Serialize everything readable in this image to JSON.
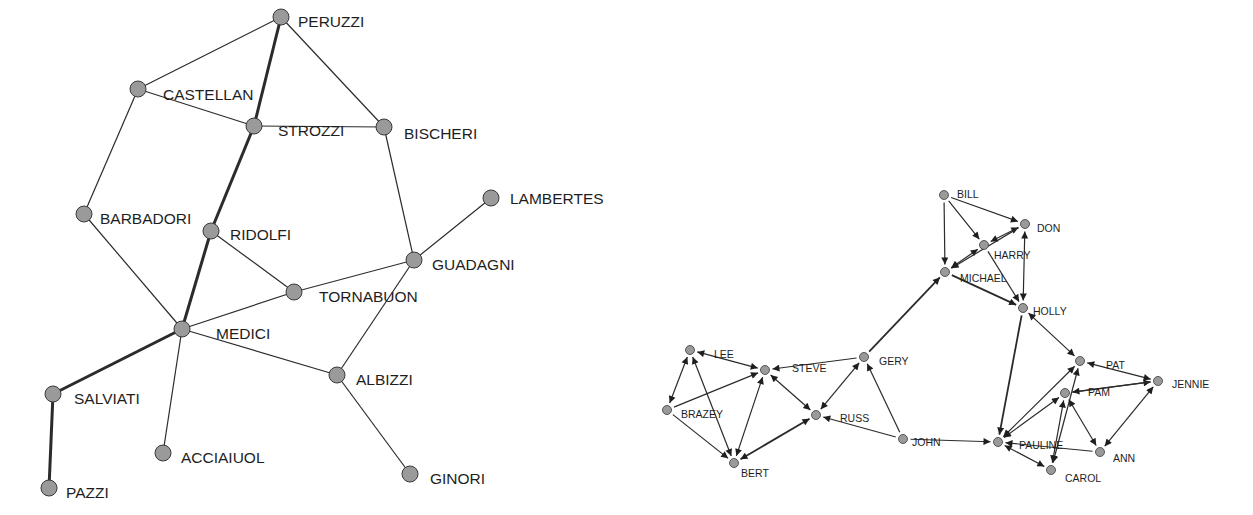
{
  "colors": {
    "background": "#ffffff",
    "node_fill": "#9a9a9a",
    "node_stroke": "#3a3a3a",
    "edge": "#2b2b2b",
    "label": "#1e1e1e"
  },
  "left_network": {
    "title": "",
    "directed": false,
    "node_radius": 8,
    "nodes": [
      {
        "id": "PERUZZI",
        "label": "PERUZZI",
        "x": 281,
        "y": 17,
        "lx": 298,
        "ly": 23
      },
      {
        "id": "CASTELLAN",
        "label": "CASTELLAN",
        "x": 138,
        "y": 89,
        "lx": 163,
        "ly": 96
      },
      {
        "id": "STROZZI",
        "label": "STROZZI",
        "x": 254,
        "y": 126,
        "lx": 278,
        "ly": 132
      },
      {
        "id": "BISCHERI",
        "label": "BISCHERI",
        "x": 384,
        "y": 127,
        "lx": 404,
        "ly": 135
      },
      {
        "id": "LAMBERTES",
        "label": "LAMBERTES",
        "x": 491,
        "y": 198,
        "lx": 510,
        "ly": 200
      },
      {
        "id": "BARBADORI",
        "label": "BARBADORI",
        "x": 84,
        "y": 214,
        "lx": 100,
        "ly": 220
      },
      {
        "id": "RIDOLFI",
        "label": "RIDOLFI",
        "x": 211,
        "y": 231,
        "lx": 230,
        "ly": 236
      },
      {
        "id": "GUADAGNI",
        "label": "GUADAGNI",
        "x": 414,
        "y": 260,
        "lx": 432,
        "ly": 266
      },
      {
        "id": "TORNABUON",
        "label": "TORNABUON",
        "x": 294,
        "y": 292,
        "lx": 319,
        "ly": 298
      },
      {
        "id": "MEDICI",
        "label": "MEDICI",
        "x": 182,
        "y": 329,
        "lx": 216,
        "ly": 335
      },
      {
        "id": "ALBIZZI",
        "label": "ALBIZZI",
        "x": 337,
        "y": 375,
        "lx": 356,
        "ly": 381
      },
      {
        "id": "SALVIATI",
        "label": "SALVIATI",
        "x": 53,
        "y": 394,
        "lx": 74,
        "ly": 400
      },
      {
        "id": "ACCIAIUOL",
        "label": "ACCIAIUOL",
        "x": 163,
        "y": 453,
        "lx": 181,
        "ly": 459
      },
      {
        "id": "GINORI",
        "label": "GINORI",
        "x": 410,
        "y": 474,
        "lx": 430,
        "ly": 480
      },
      {
        "id": "PAZZI",
        "label": "PAZZI",
        "x": 49,
        "y": 488,
        "lx": 66,
        "ly": 494
      }
    ],
    "edges": [
      {
        "from": "PERUZZI",
        "to": "CASTELLAN",
        "width": 1.2
      },
      {
        "from": "PERUZZI",
        "to": "STROZZI",
        "width": 3
      },
      {
        "from": "PERUZZI",
        "to": "BISCHERI",
        "width": 1.2
      },
      {
        "from": "CASTELLAN",
        "to": "STROZZI",
        "width": 1.2
      },
      {
        "from": "CASTELLAN",
        "to": "BARBADORI",
        "width": 1.2
      },
      {
        "from": "STROZZI",
        "to": "BISCHERI",
        "width": 1.2
      },
      {
        "from": "STROZZI",
        "to": "RIDOLFI",
        "width": 3
      },
      {
        "from": "BISCHERI",
        "to": "GUADAGNI",
        "width": 1.2
      },
      {
        "from": "LAMBERTES",
        "to": "GUADAGNI",
        "width": 1.2
      },
      {
        "from": "BARBADORI",
        "to": "MEDICI",
        "width": 1.2
      },
      {
        "from": "RIDOLFI",
        "to": "TORNABUON",
        "width": 1.2
      },
      {
        "from": "RIDOLFI",
        "to": "MEDICI",
        "width": 3
      },
      {
        "from": "GUADAGNI",
        "to": "TORNABUON",
        "width": 1.2
      },
      {
        "from": "GUADAGNI",
        "to": "ALBIZZI",
        "width": 1.2
      },
      {
        "from": "TORNABUON",
        "to": "MEDICI",
        "width": 1.2
      },
      {
        "from": "MEDICI",
        "to": "ALBIZZI",
        "width": 1.2
      },
      {
        "from": "MEDICI",
        "to": "SALVIATI",
        "width": 3
      },
      {
        "from": "MEDICI",
        "to": "ACCIAIUOL",
        "width": 1.2
      },
      {
        "from": "ALBIZZI",
        "to": "GINORI",
        "width": 1.2
      },
      {
        "from": "SALVIATI",
        "to": "PAZZI",
        "width": 3
      }
    ]
  },
  "right_network": {
    "title": "",
    "directed": true,
    "node_radius": 4.5,
    "nodes": [
      {
        "id": "BILL",
        "label": "BILL",
        "x": 944,
        "y": 195,
        "lx": 957,
        "ly": 195
      },
      {
        "id": "DON",
        "label": "DON",
        "x": 1025,
        "y": 224,
        "lx": 1037,
        "ly": 229
      },
      {
        "id": "HARRY",
        "label": "HARRY",
        "x": 984,
        "y": 245,
        "lx": 994,
        "ly": 256
      },
      {
        "id": "MICHAEL",
        "label": "MICHAEL",
        "x": 945,
        "y": 272,
        "lx": 960,
        "ly": 279
      },
      {
        "id": "HOLLY",
        "label": "HOLLY",
        "x": 1023,
        "y": 308,
        "lx": 1033,
        "ly": 312
      },
      {
        "id": "PAT",
        "label": "PAT",
        "x": 1080,
        "y": 361,
        "lx": 1106,
        "ly": 366
      },
      {
        "id": "JENNIE",
        "label": "JENNIE",
        "x": 1158,
        "y": 381,
        "lx": 1172,
        "ly": 385
      },
      {
        "id": "PAM",
        "label": "PAM",
        "x": 1065,
        "y": 393,
        "lx": 1088,
        "ly": 393
      },
      {
        "id": "PAULINE",
        "label": "PAULINE",
        "x": 998,
        "y": 442,
        "lx": 1019,
        "ly": 446
      },
      {
        "id": "ANN",
        "label": "ANN",
        "x": 1100,
        "y": 452,
        "lx": 1113,
        "ly": 459
      },
      {
        "id": "CAROL",
        "label": "CAROL",
        "x": 1051,
        "y": 470,
        "lx": 1065,
        "ly": 479
      },
      {
        "id": "LEE",
        "label": "LEE",
        "x": 690,
        "y": 350,
        "lx": 714,
        "ly": 355
      },
      {
        "id": "STEVE",
        "label": "STEVE",
        "x": 765,
        "y": 370,
        "lx": 792,
        "ly": 369
      },
      {
        "id": "GERY",
        "label": "GERY",
        "x": 864,
        "y": 357,
        "lx": 879,
        "ly": 362
      },
      {
        "id": "BRAZEY",
        "label": "BRAZEY",
        "x": 667,
        "y": 410,
        "lx": 681,
        "ly": 415
      },
      {
        "id": "RUSS",
        "label": "RUSS",
        "x": 816,
        "y": 415,
        "lx": 840,
        "ly": 419
      },
      {
        "id": "JOHN",
        "label": "JOHN",
        "x": 903,
        "y": 439,
        "lx": 912,
        "ly": 443
      },
      {
        "id": "BERT",
        "label": "BERT",
        "x": 734,
        "y": 463,
        "lx": 741,
        "ly": 474
      }
    ],
    "edges": [
      {
        "from": "BILL",
        "to": "DON",
        "both": false
      },
      {
        "from": "BILL",
        "to": "HARRY",
        "both": false
      },
      {
        "from": "BILL",
        "to": "MICHAEL",
        "both": false
      },
      {
        "from": "HARRY",
        "to": "DON",
        "both": true
      },
      {
        "from": "MICHAEL",
        "to": "HARRY",
        "both": true
      },
      {
        "from": "DON",
        "to": "MICHAEL",
        "both": false
      },
      {
        "from": "DON",
        "to": "HOLLY",
        "both": true
      },
      {
        "from": "MICHAEL",
        "to": "HOLLY",
        "both": false,
        "width": 1.8
      },
      {
        "from": "HARRY",
        "to": "HOLLY",
        "both": false
      },
      {
        "from": "GERY",
        "to": "MICHAEL",
        "both": false,
        "width": 1.8
      },
      {
        "from": "HOLLY",
        "to": "PAT",
        "both": true
      },
      {
        "from": "HOLLY",
        "to": "PAULINE",
        "both": false,
        "width": 1.8
      },
      {
        "from": "PAT",
        "to": "JENNIE",
        "both": true
      },
      {
        "from": "PAM",
        "to": "JENNIE",
        "both": false
      },
      {
        "from": "JENNIE",
        "to": "PAM",
        "both": false
      },
      {
        "from": "ANN",
        "to": "JENNIE",
        "both": true
      },
      {
        "from": "PAULINE",
        "to": "PAT",
        "both": true
      },
      {
        "from": "PAULINE",
        "to": "PAM",
        "both": true
      },
      {
        "from": "CAROL",
        "to": "PAT",
        "both": true
      },
      {
        "from": "CAROL",
        "to": "PAM",
        "both": true
      },
      {
        "from": "PAM",
        "to": "ANN",
        "both": true
      },
      {
        "from": "ANN",
        "to": "PAULINE",
        "both": false
      },
      {
        "from": "PAULINE",
        "to": "CAROL",
        "both": true
      },
      {
        "from": "JOHN",
        "to": "PAULINE",
        "both": false
      },
      {
        "from": "JOHN",
        "to": "GERY",
        "both": false
      },
      {
        "from": "JOHN",
        "to": "RUSS",
        "both": false
      },
      {
        "from": "GERY",
        "to": "STEVE",
        "both": false
      },
      {
        "from": "GERY",
        "to": "RUSS",
        "both": true
      },
      {
        "from": "STEVE",
        "to": "RUSS",
        "both": true
      },
      {
        "from": "LEE",
        "to": "STEVE",
        "both": true
      },
      {
        "from": "BRAZEY",
        "to": "STEVE",
        "both": false
      },
      {
        "from": "LEE",
        "to": "BRAZEY",
        "both": true
      },
      {
        "from": "BRAZEY",
        "to": "BERT",
        "both": false
      },
      {
        "from": "BERT",
        "to": "LEE",
        "both": true
      },
      {
        "from": "BERT",
        "to": "STEVE",
        "both": true
      },
      {
        "from": "BERT",
        "to": "RUSS",
        "both": true,
        "width": 1.8
      }
    ]
  }
}
